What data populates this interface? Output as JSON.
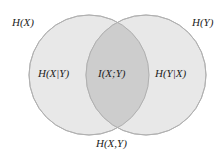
{
  "diagram": {
    "type": "venn",
    "colors": {
      "background": "#ffffff",
      "circle_fill": "#e6e6e6",
      "intersection_fill": "#cfcfcf",
      "circle_stroke": "#b5b5b5",
      "text": "#222222"
    },
    "sets": [
      {
        "id": "X",
        "label": "H(X)"
      },
      {
        "id": "Y",
        "label": "H(Y)"
      }
    ],
    "regions": {
      "left_only": "H(X|Y)",
      "intersection": "I(X;Y)",
      "right_only": "H(Y|X)",
      "union": "H(X,Y)"
    }
  }
}
